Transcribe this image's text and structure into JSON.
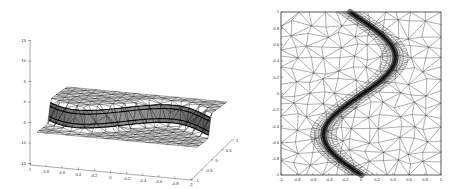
{
  "figure": {
    "panels": [
      {
        "id": "left",
        "kind": "3d-mesh-surface",
        "description": "Adaptive triangular mesh surface with a steep sinusoidal front (shock layer) between two plateaus",
        "z_axis_ticks": [
          "15",
          "10",
          "5",
          "0",
          "-5",
          "-10",
          "-15"
        ],
        "x_axis_ticks": [
          "1",
          "0.8",
          "0.6",
          "0.4",
          "0.2",
          "0",
          "-0.2",
          "-0.4",
          "-0.6",
          "-0.8",
          "-1"
        ],
        "y_axis_ticks": [
          "-1",
          "-0.5",
          "0",
          "0.5",
          "1"
        ],
        "line_color": "#222222"
      },
      {
        "id": "right",
        "kind": "2d-triangulation",
        "description": "Top view of adaptive triangulation refined along a sinusoidal curve",
        "y_axis_ticks": [
          "1",
          "0.8",
          "0.6",
          "0.4",
          "0.2",
          "0",
          "-0.2",
          "-0.4",
          "-0.6",
          "-0.8",
          "-1"
        ],
        "x_axis_ticks": [
          "-1",
          "-0.8",
          "-0.6",
          "-0.4",
          "-0.2",
          "0",
          "0.2",
          "0.4",
          "0.6",
          "0.8",
          "1"
        ],
        "line_color": "#222222"
      }
    ]
  },
  "chart_data": [
    {
      "type": "surface",
      "title": "",
      "xlabel": "",
      "ylabel": "",
      "zlabel": "",
      "xlim": [
        -1,
        1
      ],
      "ylim": [
        -1,
        1
      ],
      "zlim": [
        -15,
        15
      ],
      "x_ticks": [
        1,
        0.8,
        0.6,
        0.4,
        0.2,
        0,
        -0.2,
        -0.4,
        -0.6,
        -0.8,
        -1
      ],
      "y_ticks": [
        -1,
        -0.5,
        0,
        0.5,
        1
      ],
      "z_ticks": [
        15,
        10,
        5,
        0,
        -5,
        -10,
        -15
      ],
      "grid": false,
      "legend": null,
      "notes": "Wireframe triangular mesh; surface has a sharp step of about 5 units along a sine-shaped front, mesh densely refined at the front."
    },
    {
      "type": "mesh",
      "title": "",
      "xlabel": "",
      "ylabel": "",
      "xlim": [
        -1,
        1
      ],
      "ylim": [
        -1,
        1
      ],
      "x_ticks": [
        -1,
        -0.8,
        -0.6,
        -0.4,
        -0.2,
        0,
        0.2,
        0.4,
        0.6,
        0.8,
        1
      ],
      "y_ticks": [
        1,
        0.8,
        0.6,
        0.4,
        0.2,
        0,
        -0.2,
        -0.4,
        -0.6,
        -0.8,
        -1
      ],
      "grid": false,
      "legend": null,
      "refinement_curve": {
        "description": "x ≈ 0.45*sin(π*y) approx; dense band follows the curve",
        "points": [
          [
            -0.45,
            1.0
          ],
          [
            -0.2,
            0.8
          ],
          [
            0.1,
            0.6
          ],
          [
            0.45,
            0.3
          ],
          [
            0.4,
            0.2
          ],
          [
            0.0,
            0.0
          ],
          [
            -0.4,
            -0.2
          ],
          [
            -0.45,
            -0.35
          ],
          [
            -0.1,
            -0.6
          ],
          [
            0.3,
            -0.8
          ],
          [
            0.5,
            -1.0
          ]
        ]
      }
    }
  ]
}
